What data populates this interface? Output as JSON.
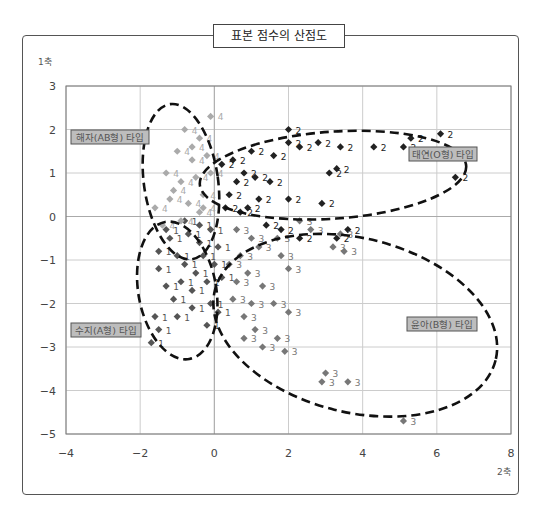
{
  "chart_data": {
    "type": "scatter",
    "title": "표본 점수의 산점도",
    "xlabel": "2축",
    "ylabel": "1축",
    "xlim": [
      -4,
      8
    ],
    "ylim": [
      -5,
      3
    ],
    "xticks": [
      "-4",
      "-2",
      "0",
      "2",
      "4",
      "6",
      "8"
    ],
    "yticks": [
      "3",
      "2",
      "1",
      "0",
      "-1",
      "-2",
      "-3",
      "-4",
      "-5"
    ],
    "grid": true,
    "series": [
      {
        "name": "1",
        "label": "수지(A형) 타입",
        "color": "#555555",
        "points": [
          [
            -1.7,
            -2.9
          ],
          [
            -1.5,
            -2.6
          ],
          [
            -1.6,
            -2.3
          ],
          [
            -1.1,
            -1.9
          ],
          [
            -1.5,
            -1.2
          ],
          [
            -1.0,
            -0.9
          ],
          [
            -0.8,
            -1.1
          ],
          [
            -1.2,
            -0.5
          ],
          [
            -0.7,
            -0.4
          ],
          [
            -0.4,
            -0.6
          ],
          [
            -0.3,
            -0.9
          ],
          [
            -0.5,
            -1.3
          ],
          [
            -0.2,
            -1.5
          ],
          [
            -0.1,
            -2.0
          ],
          [
            -0.6,
            -1.7
          ],
          [
            -0.9,
            -1.5
          ],
          [
            -1.3,
            -1.6
          ],
          [
            -0.2,
            -2.5
          ],
          [
            0.1,
            -2.2
          ],
          [
            -0.4,
            -0.2
          ],
          [
            -0.8,
            -0.1
          ],
          [
            -0.1,
            -0.3
          ],
          [
            0.1,
            -0.7
          ],
          [
            -1.5,
            -0.8
          ],
          [
            -1.3,
            -0.3
          ],
          [
            -0.6,
            -2.1
          ],
          [
            -1.0,
            -2.3
          ],
          [
            0.0,
            -1.1
          ],
          [
            0.2,
            -1.4
          ]
        ]
      },
      {
        "name": "2",
        "label": "태연(O형) 타입",
        "color": "#222222",
        "points": [
          [
            2.0,
            2.0
          ],
          [
            2.0,
            1.7
          ],
          [
            2.3,
            1.6
          ],
          [
            3.4,
            1.6
          ],
          [
            2.8,
            1.7
          ],
          [
            1.6,
            1.4
          ],
          [
            1.0,
            1.5
          ],
          [
            4.3,
            1.6
          ],
          [
            5.3,
            1.8
          ],
          [
            5.1,
            1.6
          ],
          [
            6.1,
            1.9
          ],
          [
            6.5,
            0.9
          ],
          [
            3.3,
            1.1
          ],
          [
            3.1,
            1.0
          ],
          [
            1.5,
            0.8
          ],
          [
            2.0,
            0.4
          ],
          [
            2.9,
            0.3
          ],
          [
            1.8,
            -0.3
          ],
          [
            2.3,
            -0.5
          ],
          [
            3.3,
            -0.5
          ],
          [
            3.6,
            -0.3
          ],
          [
            0.8,
            1.0
          ],
          [
            0.6,
            0.8
          ],
          [
            0.4,
            0.5
          ],
          [
            0.9,
            0.2
          ],
          [
            1.2,
            0.4
          ],
          [
            0.2,
            1.2
          ],
          [
            0.5,
            1.3
          ],
          [
            1.1,
            0.9
          ],
          [
            0.7,
            0.1
          ],
          [
            0.3,
            0.2
          ],
          [
            1.4,
            -0.2
          ]
        ]
      },
      {
        "name": "3",
        "label": "윤아(B형) 타입",
        "color": "#777777",
        "points": [
          [
            3.0,
            -3.6
          ],
          [
            2.9,
            -3.8
          ],
          [
            3.6,
            -3.8
          ],
          [
            5.1,
            -4.7
          ],
          [
            2.0,
            -2.2
          ],
          [
            1.6,
            -2.0
          ],
          [
            1.7,
            -2.8
          ],
          [
            1.3,
            -3.0
          ],
          [
            0.8,
            -2.8
          ],
          [
            1.1,
            -2.6
          ],
          [
            1.9,
            -3.1
          ],
          [
            1.0,
            -2.0
          ],
          [
            0.6,
            -1.5
          ],
          [
            0.9,
            -1.3
          ],
          [
            1.3,
            -1.6
          ],
          [
            2.0,
            -1.2
          ],
          [
            1.7,
            -0.5
          ],
          [
            1.8,
            -0.9
          ],
          [
            3.2,
            -0.7
          ],
          [
            3.5,
            -0.8
          ],
          [
            3.4,
            -0.4
          ],
          [
            2.6,
            -0.3
          ],
          [
            1.2,
            -0.7
          ],
          [
            0.7,
            -0.9
          ],
          [
            0.4,
            -1.1
          ],
          [
            0.6,
            -0.3
          ],
          [
            1.0,
            -0.5
          ],
          [
            2.3,
            -0.1
          ],
          [
            0.5,
            -1.9
          ],
          [
            0.8,
            -2.3
          ]
        ]
      },
      {
        "name": "4",
        "label": "해자(AB형) 타입",
        "color": "#aaaaaa",
        "points": [
          [
            -0.1,
            2.3
          ],
          [
            -0.8,
            2.0
          ],
          [
            -0.4,
            1.8
          ],
          [
            -1.0,
            1.5
          ],
          [
            -0.6,
            1.3
          ],
          [
            -0.2,
            1.4
          ],
          [
            -1.3,
            1.0
          ],
          [
            -0.9,
            0.8
          ],
          [
            -0.5,
            0.9
          ],
          [
            -0.1,
            1.0
          ],
          [
            -1.2,
            0.4
          ],
          [
            -0.7,
            0.3
          ],
          [
            -0.3,
            0.5
          ],
          [
            -1.6,
            0.2
          ],
          [
            -0.9,
            -0.1
          ],
          [
            -0.4,
            0.1
          ],
          [
            -1.4,
            -0.2
          ],
          [
            -0.6,
            1.6
          ],
          [
            -0.3,
            0.2
          ],
          [
            -1.1,
            0.6
          ]
        ]
      }
    ],
    "annotations": [
      {
        "text": "해자(AB형) 타입",
        "cluster": "4"
      },
      {
        "text": "태연(O형) 타입",
        "cluster": "2"
      },
      {
        "text": "수지(A형) 타입",
        "cluster": "1"
      },
      {
        "text": "윤아(B형) 타입",
        "cluster": "3"
      }
    ]
  }
}
